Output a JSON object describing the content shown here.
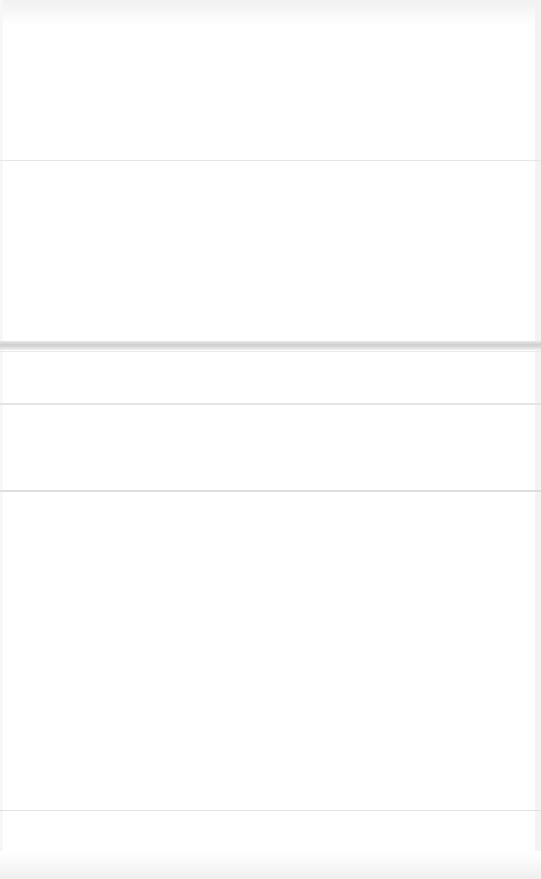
{
  "page": {
    "state": "blank",
    "background_color": "#ffffff",
    "divider_color": "#e3e3e3",
    "toolbar_bar_color": "#cfcfcf"
  },
  "header": {
    "title": ""
  },
  "sections": [
    {
      "id": "section-1",
      "label": ""
    },
    {
      "id": "section-2",
      "label": ""
    },
    {
      "id": "section-3",
      "label": ""
    },
    {
      "id": "section-4",
      "label": ""
    },
    {
      "id": "section-5",
      "label": ""
    },
    {
      "id": "section-6",
      "label": ""
    }
  ],
  "footer": {
    "status": ""
  }
}
